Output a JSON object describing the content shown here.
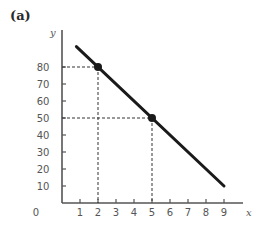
{
  "panel_label": "(a)",
  "chart_data": {
    "type": "line",
    "title": "",
    "panel": "(a)",
    "xlabel": "x",
    "ylabel": "y",
    "xlim": [
      0,
      9.5
    ],
    "ylim": [
      0,
      100
    ],
    "x_ticks": [
      1,
      2,
      3,
      4,
      5,
      6,
      7,
      8,
      9
    ],
    "y_ticks": [
      10,
      20,
      30,
      40,
      50,
      60,
      70,
      80
    ],
    "origin_label": "0",
    "grid": false,
    "series": [
      {
        "name": "line",
        "x": [
          0.8,
          9
        ],
        "y": [
          92,
          10
        ],
        "equation": "y = 100 - 10x",
        "color": "#1a1a1a"
      }
    ],
    "highlighted_points": [
      {
        "x": 2,
        "y": 80,
        "guides": "dashed"
      },
      {
        "x": 5,
        "y": 50,
        "guides": "dashed"
      }
    ]
  },
  "colors": {
    "axis": "#555555",
    "line": "#1a1a1a",
    "guide": "#333333",
    "text": "#555555"
  }
}
